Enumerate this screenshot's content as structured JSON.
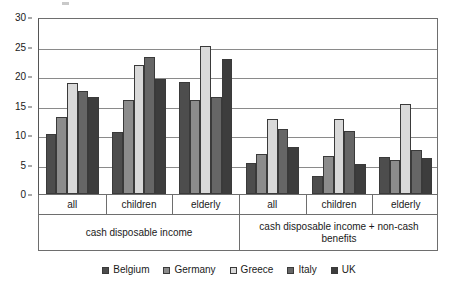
{
  "chart_data": {
    "type": "bar",
    "title": "",
    "subtitle": "",
    "xlabel": "",
    "ylabel": "",
    "ylim": [
      0,
      30
    ],
    "yticks": [
      0,
      5,
      10,
      15,
      20,
      25,
      30
    ],
    "ytick_labels": [
      "0",
      "5",
      "10",
      "15",
      "20",
      "25",
      "30"
    ],
    "grid": true,
    "grid_axis": "y",
    "legend_position": "bottom",
    "orientation": "vertical",
    "group_labels": [
      "all",
      "children",
      "elderly",
      "all",
      "children",
      "elderly"
    ],
    "panels": [
      {
        "label": "cash disposable income",
        "categories": [
          "all",
          "children",
          "elderly"
        ]
      },
      {
        "label": "cash disposable income + non-cash benefits",
        "categories": [
          "all",
          "children",
          "elderly"
        ]
      }
    ],
    "categories": [
      "cash disposable income / all",
      "cash disposable income / children",
      "cash disposable income / elderly",
      "cash disposable income + non-cash benefits / all",
      "cash disposable income + non-cash benefits / children",
      "cash disposable income + non-cash benefits / elderly"
    ],
    "series": [
      {
        "name": "Belgium",
        "color": "#4d4d4d",
        "values": [
          10.2,
          10.5,
          19.0,
          5.3,
          3.1,
          6.2
        ]
      },
      {
        "name": "Germany",
        "color": "#8c8c8c",
        "values": [
          13.0,
          15.9,
          16.0,
          6.8,
          6.5,
          5.7
        ]
      },
      {
        "name": "Greece",
        "color": "#d9d9d9",
        "values": [
          18.8,
          21.8,
          25.1,
          12.7,
          12.7,
          15.2
        ]
      },
      {
        "name": "Italy",
        "color": "#666666",
        "values": [
          17.5,
          23.3,
          16.4,
          11.1,
          10.6,
          7.5
        ]
      },
      {
        "name": "UK",
        "color": "#3d3d3d",
        "values": [
          16.5,
          19.5,
          22.9,
          7.9,
          5.1,
          6.1
        ]
      }
    ]
  },
  "legend": {
    "items": [
      {
        "label": "Belgium",
        "color": "#4d4d4d"
      },
      {
        "label": "Germany",
        "color": "#8c8c8c"
      },
      {
        "label": "Greece",
        "color": "#d9d9d9"
      },
      {
        "label": "Italy",
        "color": "#666666"
      },
      {
        "label": "UK",
        "color": "#3d3d3d"
      }
    ]
  }
}
